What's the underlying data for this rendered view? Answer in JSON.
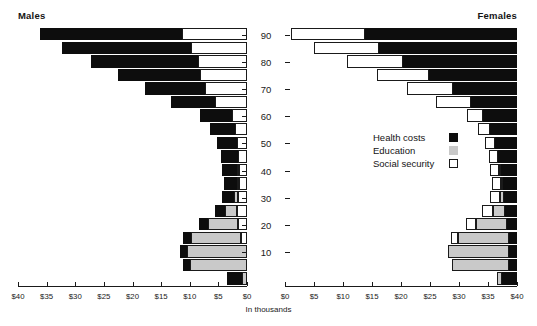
{
  "panels": {
    "left_title": "Males",
    "right_title": "Females"
  },
  "units_label": "In thousands",
  "legend": {
    "position": "center-right",
    "items": [
      {
        "label": "Health costs",
        "color": "#0d0d0d",
        "swatch": "filled-black-square"
      },
      {
        "label": "Education",
        "color": "#c9c9c9",
        "swatch": "filled-gray-square"
      },
      {
        "label": "Social security",
        "color": "#ffffff",
        "swatch": "outlined-white-square"
      }
    ]
  },
  "axis": {
    "tick_labels": [
      "$40",
      "$35",
      "$30",
      "$25",
      "$20",
      "$15",
      "$10",
      "$5",
      "$0"
    ],
    "tick_values": [
      40,
      35,
      30,
      25,
      20,
      15,
      10,
      5,
      0
    ],
    "max": 40,
    "step": 5
  },
  "age_axis": {
    "labels": [
      "10",
      "20",
      "30",
      "40",
      "50",
      "60",
      "70",
      "80",
      "90"
    ],
    "values": [
      10,
      20,
      30,
      40,
      50,
      60,
      70,
      80,
      90
    ]
  },
  "chart_data": {
    "type": "bar",
    "subtype": "population-pyramid-stacked-horizontal",
    "title": "",
    "xlabel": "In thousands",
    "ylabel": "",
    "xlim": [
      0,
      40
    ],
    "xtick_step": 5,
    "grid": false,
    "legend_position": "center-right",
    "categories": [
      "0-4",
      "5-9",
      "10-14",
      "15-19",
      "20-24",
      "25-29",
      "30-34",
      "35-39",
      "40-44",
      "45-49",
      "50-54",
      "55-59",
      "60-64",
      "65-69",
      "70-74",
      "75-79",
      "80-84",
      "85-89",
      "90+"
    ],
    "category_axis_labels": [
      "10",
      "20",
      "30",
      "40",
      "50",
      "60",
      "70",
      "80",
      "90"
    ],
    "segment_names": [
      "Health costs",
      "Education",
      "Social security"
    ],
    "panels": [
      {
        "name": "Males",
        "direction": "left",
        "series": [
          {
            "name": "Health costs",
            "values": [
              2.6,
              1.3,
              1.3,
              1.4,
              1.6,
              1.8,
              2.0,
              2.2,
              2.6,
              3.0,
              3.6,
              4.4,
              5.6,
              7.6,
              10.4,
              14.4,
              18.6,
              22.6,
              24.8
            ]
          },
          {
            "name": "Education",
            "values": [
              0.9,
              9.9,
              10.4,
              8.6,
              5.2,
              2.1,
              0.8,
              0.3,
              0.1,
              0.0,
              0.0,
              0.0,
              0.0,
              0.0,
              0.0,
              0.0,
              0.0,
              0.0,
              0.0
            ]
          },
          {
            "name": "Social security",
            "values": [
              0.0,
              0.0,
              0.0,
              1.1,
              1.6,
              1.7,
              1.5,
              1.4,
              1.4,
              1.5,
              1.7,
              2.1,
              2.6,
              5.6,
              7.4,
              8.2,
              8.6,
              9.8,
              11.4
            ]
          }
        ]
      },
      {
        "name": "Females",
        "direction": "right",
        "series": [
          {
            "name": "Health costs",
            "values": [
              2.6,
              1.3,
              1.3,
              1.4,
              1.7,
              2.0,
              2.2,
              2.4,
              2.8,
              3.2,
              3.8,
              4.6,
              5.8,
              8.0,
              11.0,
              15.2,
              19.6,
              23.8,
              26.2
            ]
          },
          {
            "name": "Education",
            "values": [
              0.9,
              9.9,
              10.6,
              8.8,
              5.4,
              2.2,
              0.8,
              0.3,
              0.1,
              0.0,
              0.0,
              0.0,
              0.0,
              0.0,
              0.0,
              0.0,
              0.0,
              0.0,
              0.0
            ]
          },
          {
            "name": "Social security",
            "values": [
              0.0,
              0.0,
              0.0,
              1.1,
              1.7,
              1.8,
              1.6,
              1.5,
              1.5,
              1.6,
              1.8,
              2.2,
              2.8,
              6.0,
              8.0,
              9.0,
              9.8,
              11.2,
              12.8
            ]
          }
        ]
      }
    ]
  }
}
